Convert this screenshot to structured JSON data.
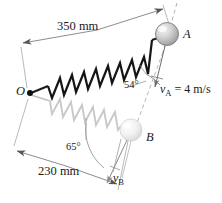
{
  "figure": {
    "type": "mechanics-diagram",
    "background_color": "#ffffff",
    "line_color": "#4a4a4a",
    "spring_color_primary": "#1a1a1a",
    "spring_color_ghost": "#c8c8c8"
  },
  "points": {
    "origin_label": "O",
    "ball_a_label": "A",
    "ball_b_label": "B"
  },
  "dimensions": {
    "top": "350 mm",
    "bottom": "230 mm"
  },
  "angles": {
    "upper": "54°",
    "lower": "65°"
  },
  "velocities": {
    "a_symbol": "v",
    "a_subscript": "A",
    "a_value": " = 4 m/s",
    "b_symbol": "v",
    "b_subscript": "B"
  },
  "geometry": {
    "origin": [
      30,
      93
    ],
    "ball_a": [
      167,
      34
    ],
    "ball_b": [
      131,
      130
    ],
    "ball_radius": 11,
    "length_oa_mm": 350,
    "length_ob_mm": 230,
    "angle_a_deg": 54,
    "angle_b_deg": 65
  }
}
